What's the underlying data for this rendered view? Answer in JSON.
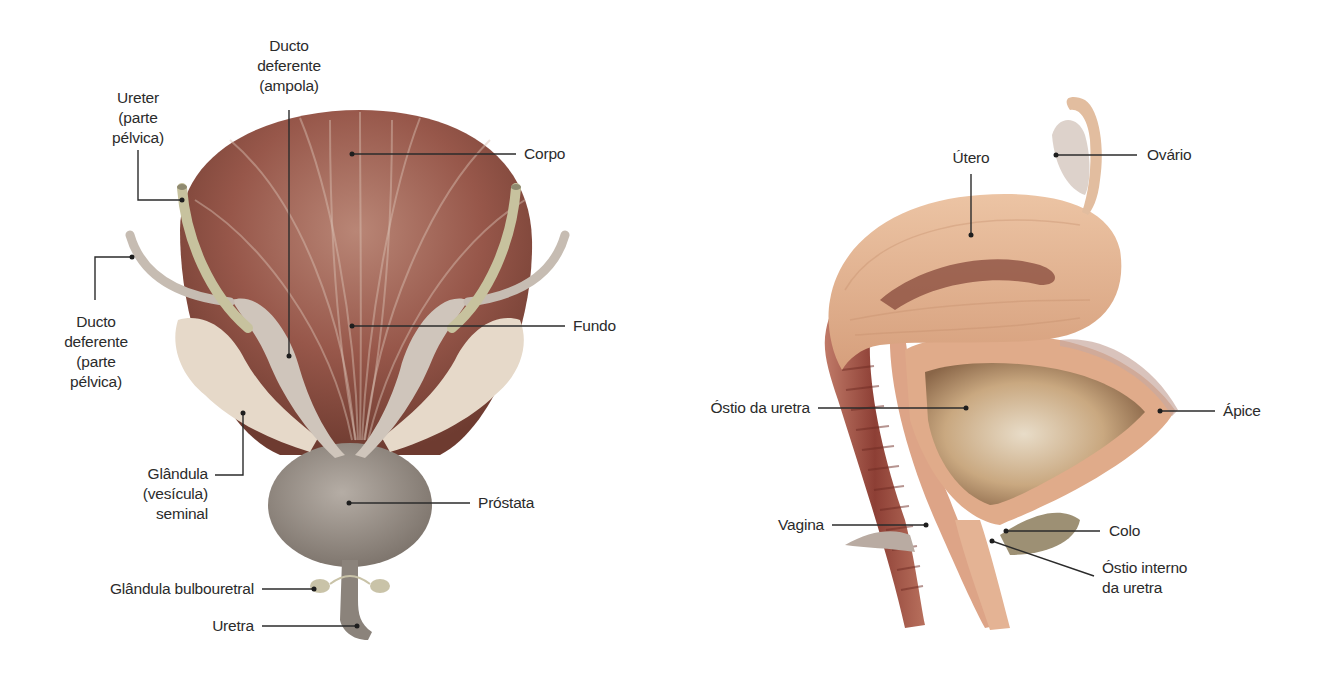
{
  "figure": {
    "panels": [
      {
        "id": "male",
        "description": "Posterior view of bladder with male pelvic structures",
        "labels": {
          "ureter": [
            "Ureter",
            "(parte",
            "pélvica)"
          ],
          "ducto_ampola": [
            "Ducto",
            "deferente",
            "(ampola)"
          ],
          "corpo": "Corpo",
          "ducto_pelvica": [
            "Ducto",
            "deferente",
            "(parte",
            "pélvica)"
          ],
          "fundo": "Fundo",
          "glandula_seminal": [
            "Glândula",
            "(vesícula)",
            "seminal"
          ],
          "prostata": "Próstata",
          "glandula_bulbouretral": "Glândula bulbouretral",
          "uretra": "Uretra"
        }
      },
      {
        "id": "female",
        "description": "Sagittal section of female bladder, uterus and vagina",
        "labels": {
          "utero": "Útero",
          "ovario": "Ovário",
          "ostio_uretra": "Óstio da uretra",
          "apice": "Ápice",
          "vagina": "Vagina",
          "colo": "Colo",
          "ostio_interno": [
            "Óstio interno",
            "da uretra"
          ]
        }
      }
    ],
    "colors": {
      "background": "#ffffff",
      "label_text": "#2b2b2b",
      "leader_line": "#2b2b2b",
      "bladder_muscle": "#9a5a48",
      "bladder_highlight": "#c9a596",
      "ureter": "#c9c4a2",
      "ductus": "#c8bdb3",
      "seminal_vesicle": "#e4d6c6",
      "prostate": "#9e958c",
      "uterus": "#e2b08d",
      "vaginal_wall": "#a5564a"
    }
  }
}
